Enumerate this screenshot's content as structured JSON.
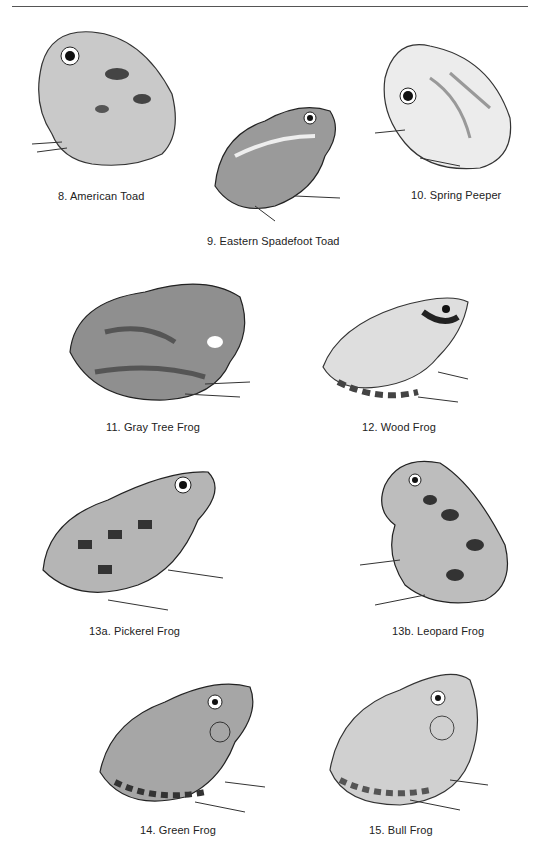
{
  "plates": [
    {
      "id": "8",
      "caption": "8. American Toad"
    },
    {
      "id": "9",
      "caption": "9. Eastern Spadefoot Toad"
    },
    {
      "id": "10",
      "caption": "10. Spring Peeper"
    },
    {
      "id": "11",
      "caption": "11. Gray Tree Frog"
    },
    {
      "id": "12",
      "caption": "12. Wood Frog"
    },
    {
      "id": "13a",
      "caption": "13a. Pickerel Frog"
    },
    {
      "id": "13b",
      "caption": "13b. Leopard Frog"
    },
    {
      "id": "14",
      "caption": "14. Green Frog"
    },
    {
      "id": "15",
      "caption": "15. Bull Frog"
    }
  ],
  "colors": {
    "ink": "#222222",
    "rule": "#555555",
    "shade": "#8a8a8a",
    "light": "#d6d6d6"
  }
}
